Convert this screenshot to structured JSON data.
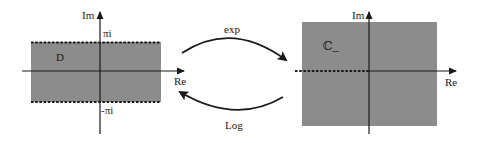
{
  "colors": {
    "region_fill": "#8c8c8c",
    "stroke": "#1a1a1a",
    "background": "#ffffff"
  },
  "left_plane": {
    "region_label": "D",
    "axis_im_label": "Im",
    "axis_re_label": "Re",
    "upper_bound_label": "πi",
    "lower_bound_label": "-πi",
    "boundary_style": "dashed"
  },
  "right_plane": {
    "region_label": "ℂ_",
    "axis_im_label": "Im",
    "axis_re_label": "Re",
    "branch_cut_style": "dashed (negative real axis)"
  },
  "maps": {
    "forward_label": "exp",
    "inverse_label": "Log"
  }
}
